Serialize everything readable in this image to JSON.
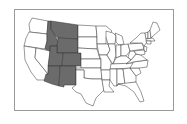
{
  "map": {
    "type": "choropleth",
    "region": "Contiguous United States",
    "highlight_color": "#6b6b6b",
    "base_color": "#ffffff",
    "border_color": "#333333",
    "frame_color": "#9a9a9a",
    "highlighted_states": [
      "Montana",
      "Idaho",
      "Wyoming",
      "Utah",
      "Colorado",
      "Arizona",
      "New Mexico"
    ],
    "states": [
      {
        "name": "Washington",
        "points": "32,18 48,21 47,34 30,32 29,24",
        "fill": "base"
      },
      {
        "name": "Oregon",
        "points": "29,32 47,34 47,41 45,49 24,46 26,38",
        "fill": "base"
      },
      {
        "name": "California",
        "points": "24,46 36,48 35,58 48,74 46,80 37,80 31,72 25,60",
        "fill": "base"
      },
      {
        "name": "Nevada",
        "points": "36,48 50,51 48,74 35,58",
        "fill": "base"
      },
      {
        "name": "Idaho",
        "points": "48,21 51,21 51,29 55,35 58,41 57,46 50,46 50,51 45,49 47,41 47,34",
        "fill": "highlight"
      },
      {
        "name": "Montana",
        "points": "51,21 78,25 78,39 58,38 55,35 51,29",
        "fill": "highlight"
      },
      {
        "name": "Wyoming",
        "points": "58,38 78,39 78,53 57,53 57,46",
        "fill": "highlight"
      },
      {
        "name": "Utah",
        "points": "50,46 57,46 57,53 63,53 62,66 48,66 50,51",
        "fill": "highlight"
      },
      {
        "name": "Colorado",
        "points": "63,53 81,53 81,66 62,66",
        "fill": "highlight"
      },
      {
        "name": "Arizona",
        "points": "48,66 60,66 59,86 52,84 44,81 46,74 48,74",
        "fill": "highlight"
      },
      {
        "name": "New Mexico",
        "points": "60,66 76,66 76,85 64,85 64,87 59,86",
        "fill": "highlight"
      },
      {
        "name": "North Dakota",
        "points": "78,25 96,26 97,37 78,37",
        "fill": "base"
      },
      {
        "name": "South Dakota",
        "points": "78,37 97,37 97,49 78,48",
        "fill": "base"
      },
      {
        "name": "Nebraska",
        "points": "78,48 97,49 100,59 81,59 81,53 78,53",
        "fill": "base"
      },
      {
        "name": "Kansas",
        "points": "81,59 101,59 101,68 81,68",
        "fill": "base"
      },
      {
        "name": "Oklahoma",
        "points": "76,68 101,68 102,79 92,79 84,78 84,70 76,70",
        "fill": "base"
      },
      {
        "name": "Texas",
        "points": "76,70 84,70 84,78 92,79 102,79 104,90 96,98 93,106 86,103 81,94 76,92 72,88 76,85",
        "fill": "base"
      },
      {
        "name": "Minnesota",
        "points": "96,26 106,26 112,31 106,37 106,44 97,44 97,37",
        "fill": "base"
      },
      {
        "name": "Iowa",
        "points": "97,44 108,44 110,50 107,55 99,55",
        "fill": "base"
      },
      {
        "name": "Missouri",
        "points": "99,55 107,55 111,62 112,70 101,70 101,59",
        "fill": "base"
      },
      {
        "name": "Arkansas",
        "points": "101,70 112,70 110,80 102,80",
        "fill": "base"
      },
      {
        "name": "Louisiana",
        "points": "102,80 110,80 109,86 114,92 104,92",
        "fill": "base"
      },
      {
        "name": "Wisconsin",
        "points": "106,31 113,33 116,36 115,44 108,44 106,37",
        "fill": "base"
      },
      {
        "name": "Illinois",
        "points": "108,44 115,44 116,55 113,64 110,60 107,55 110,50",
        "fill": "base"
      },
      {
        "name": "Michigan",
        "points": "115,33 122,36 124,44 119,45 116,42 116,36",
        "fill": "base"
      },
      {
        "name": "Indiana",
        "points": "116,45 121,45 121,56 116,58 116,55",
        "fill": "base"
      },
      {
        "name": "Ohio",
        "points": "121,45 128,44 130,51 126,56 121,56",
        "fill": "base"
      },
      {
        "name": "Kentucky",
        "points": "113,64 116,58 121,56 126,56 131,60 126,64",
        "fill": "base"
      },
      {
        "name": "Tennessee",
        "points": "111,64 134,63 133,68 110,69",
        "fill": "base"
      },
      {
        "name": "Mississippi",
        "points": "110,69 117,69 117,86 114,86 110,80",
        "fill": "base"
      },
      {
        "name": "Alabama",
        "points": "117,69 123,69 125,84 118,84 117,86",
        "fill": "base"
      },
      {
        "name": "Georgia",
        "points": "123,69 130,68 136,76 136,82 125,84",
        "fill": "base"
      },
      {
        "name": "Florida",
        "points": "118,84 136,82 141,92 144,101 140,102 134,92 126,86",
        "fill": "base"
      },
      {
        "name": "South Carolina",
        "points": "130,68 139,68 141,73 136,76",
        "fill": "base"
      },
      {
        "name": "North Carolina",
        "points": "133,62 148,60 147,67 139,68 130,68 133,63",
        "fill": "base"
      },
      {
        "name": "Virginia",
        "points": "126,64 131,60 136,54 141,55 147,60 133,62",
        "fill": "base"
      },
      {
        "name": "West Virginia",
        "points": "130,51 134,51 136,54 131,60 128,57",
        "fill": "base"
      },
      {
        "name": "Pennsylvania",
        "points": "128,44 142,43 144,49 130,51",
        "fill": "base"
      },
      {
        "name": "New York",
        "points": "130,43 136,38 141,33 145,33 147,42 144,46 142,43",
        "fill": "base"
      },
      {
        "name": "New Jersey",
        "points": "144,46 147,47 146,52 144,50",
        "fill": "base"
      },
      {
        "name": "Maryland",
        "points": "134,51 144,50 145,54 141,55 136,54",
        "fill": "base"
      },
      {
        "name": "Vermont",
        "points": "145,33 148,32 148,39 146,39",
        "fill": "base"
      },
      {
        "name": "New Hampshire",
        "points": "148,32 150,30 151,38 148,39",
        "fill": "base"
      },
      {
        "name": "Massachusetts",
        "points": "146,39 153,38 155,41 146,41",
        "fill": "base"
      },
      {
        "name": "Connecticut",
        "points": "146,41 151,41 151,44 147,44",
        "fill": "base"
      },
      {
        "name": "Maine",
        "points": "150,30 153,22 157,23 160,30 153,36 151,38",
        "fill": "base"
      }
    ]
  }
}
